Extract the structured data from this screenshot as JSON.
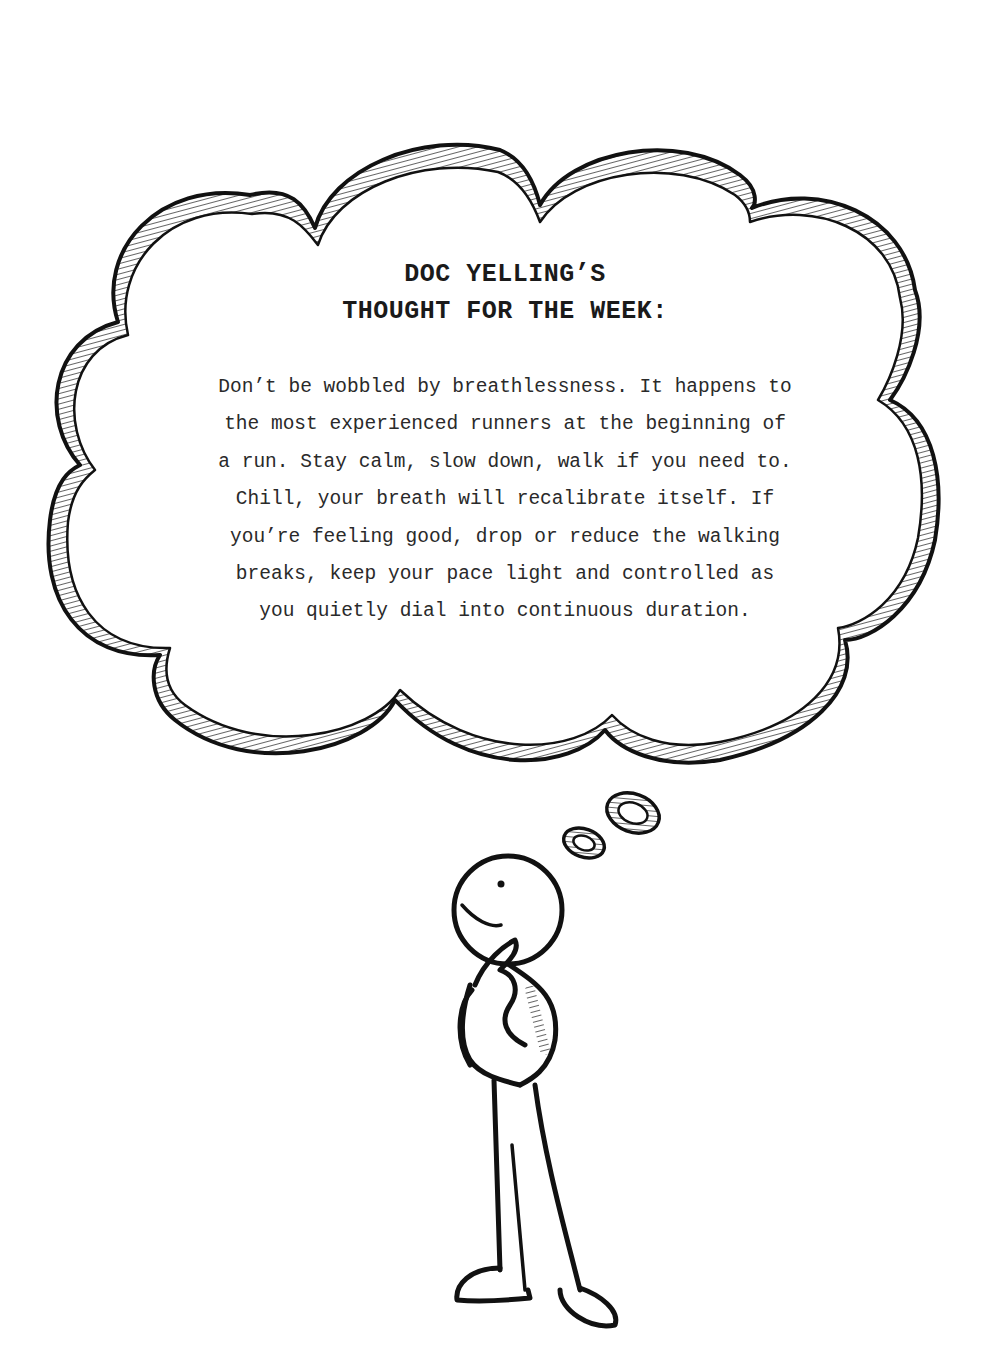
{
  "title": {
    "line1": "DOC YELLING’S",
    "line2": "THOUGHT FOR THE WEEK:"
  },
  "body": {
    "lines": [
      "Don’t be wobbled by breathlessness. It happens to",
      "the most experienced runners at the beginning of",
      "a run. Stay calm, slow down, walk if you need to.",
      "Chill, your breath will recalibrate itself. If",
      "you’re feeling good, drop or reduce the walking",
      "breaks, keep your pace light and controlled as",
      "you quietly dial into continuous duration."
    ]
  },
  "illustration": {
    "thought_cloud": "thought-cloud-icon",
    "thought_bubbles": "thought-bubble-icon",
    "figure": "thinking-stick-figure-icon"
  },
  "colors": {
    "ink": "#111111",
    "text": "#2a2a2a",
    "paper": "#ffffff"
  }
}
